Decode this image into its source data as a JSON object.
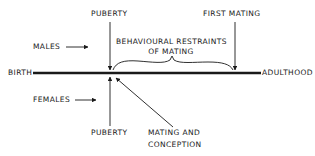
{
  "diagram": {
    "timeline": {
      "start_label": "BIRTH",
      "end_label": "ADULTHOOD"
    },
    "males": {
      "label": "MALES",
      "events": {
        "puberty": "PUBERTY",
        "first_mating": "FIRST MATING"
      },
      "interval_label_line1": "BEHAVIOURAL RESTRAINTS",
      "interval_label_line2": "OF MATING"
    },
    "females": {
      "label": "FEMALES",
      "events": {
        "puberty": "PUBERTY",
        "mating_line1": "MATING AND",
        "mating_line2": "CONCEPTION"
      }
    },
    "colors": {
      "ink": "#1a1a1a",
      "background": "#ffffff"
    }
  }
}
